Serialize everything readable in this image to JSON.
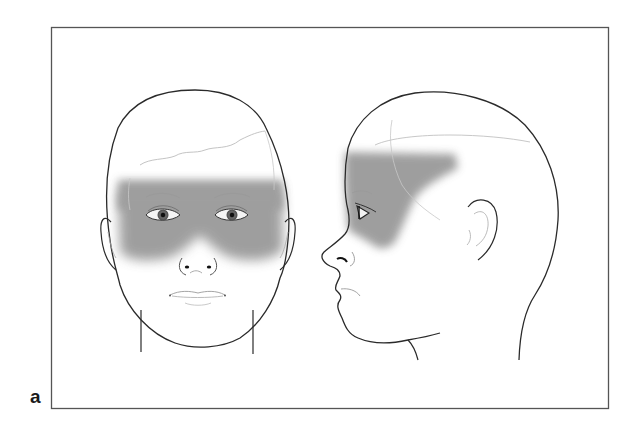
{
  "figure": {
    "panel_label": "a",
    "frame_color": "#555555",
    "line_color": "#2a2a2a",
    "faint_line_color": "#b8b8b8",
    "shading_color": "#8e8e8e",
    "views": [
      {
        "name": "frontal-view",
        "shaded_region": "forehead, periorbital area and upper cheeks"
      },
      {
        "name": "lateral-view",
        "shaded_region": "forehead, temple and periorbital area"
      }
    ]
  }
}
